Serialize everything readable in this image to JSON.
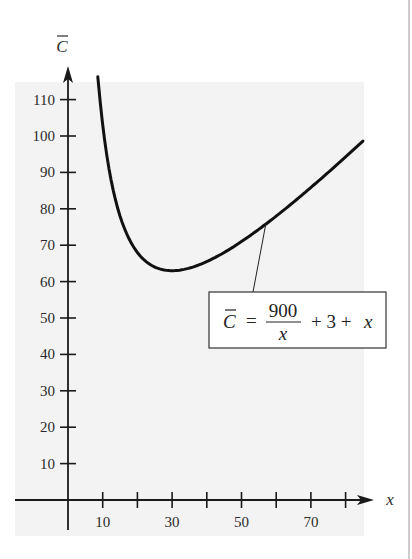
{
  "chart_data": {
    "type": "line",
    "title": "",
    "xlabel": "x",
    "ylabel": "C̄",
    "function": "C̄ = 900/x + 3 + x",
    "xlim": [
      0,
      85
    ],
    "ylim": [
      0,
      115
    ],
    "x_ticks": [
      10,
      20,
      30,
      40,
      50,
      60,
      70,
      80
    ],
    "x_tick_labels": [
      "10",
      "30",
      "50",
      "70"
    ],
    "x_tick_label_values": [
      10,
      30,
      50,
      70
    ],
    "y_ticks": [
      10,
      20,
      30,
      40,
      50,
      60,
      70,
      80,
      90,
      100,
      110
    ],
    "y_tick_labels": [
      "10",
      "20",
      "30",
      "40",
      "50",
      "60",
      "70",
      "80",
      "90",
      "100",
      "110"
    ],
    "series": [
      {
        "name": "C̄ = 900/x + 3 + x",
        "x": [
          8.6,
          10,
          15,
          20,
          25,
          30,
          35,
          40,
          45,
          50,
          55,
          60,
          65,
          70,
          75,
          80,
          85
        ],
        "values": [
          116.3,
          103,
          78,
          68,
          64,
          63,
          63.7,
          65.5,
          68,
          71,
          74.4,
          78,
          81.8,
          85.9,
          90,
          94.3,
          98.6
        ]
      }
    ],
    "annotation": {
      "lhs": "C̄",
      "equals": "=",
      "numerator": "900",
      "denominator": "x",
      "rest": "+ 3 + x",
      "points_to_x": 57
    },
    "grid": false,
    "colors": {
      "plot_bg": "#f3f3f3",
      "line": "#111111",
      "axis": "#1a1a1a"
    }
  }
}
